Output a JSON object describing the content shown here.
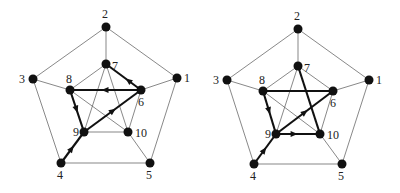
{
  "figure": {
    "type": "Petersen graph with directed path highlights",
    "panels": [
      {
        "id": "left",
        "nodes": [
          {
            "id": "1",
            "x": 177,
            "y": 78,
            "lx": 184,
            "ly": 82
          },
          {
            "id": "2",
            "x": 106,
            "y": 27,
            "lx": 102,
            "ly": 18
          },
          {
            "id": "3",
            "x": 33,
            "y": 79,
            "lx": 19,
            "ly": 83
          },
          {
            "id": "4",
            "x": 61,
            "y": 163,
            "lx": 57,
            "ly": 179
          },
          {
            "id": "5",
            "x": 150,
            "y": 163,
            "lx": 146,
            "ly": 179
          },
          {
            "id": "6",
            "x": 141,
            "y": 90,
            "lx": 138,
            "ly": 106
          },
          {
            "id": "7",
            "x": 106,
            "y": 64,
            "lx": 112,
            "ly": 70
          },
          {
            "id": "8",
            "x": 70,
            "y": 90,
            "lx": 66,
            "ly": 83
          },
          {
            "id": "9",
            "x": 84,
            "y": 132,
            "lx": 73,
            "ly": 136
          },
          {
            "id": "10",
            "x": 128,
            "y": 132,
            "lx": 135,
            "ly": 137
          }
        ],
        "thin_edges": [
          [
            "1",
            "2"
          ],
          [
            "2",
            "3"
          ],
          [
            "3",
            "4"
          ],
          [
            "4",
            "5"
          ],
          [
            "5",
            "1"
          ],
          [
            "1",
            "6"
          ],
          [
            "2",
            "7"
          ],
          [
            "3",
            "8"
          ],
          [
            "5",
            "10"
          ],
          [
            "7",
            "9"
          ],
          [
            "7",
            "10"
          ],
          [
            "8",
            "10"
          ],
          [
            "9",
            "10"
          ],
          [
            "6",
            "10"
          ],
          [
            "7",
            "8"
          ]
        ],
        "thick_edges": [
          {
            "from": "4",
            "to": "9",
            "arrow_t": 0.45
          },
          {
            "from": "9",
            "to": "6",
            "arrow_t": 0.5
          },
          {
            "from": "6",
            "to": "8",
            "arrow_t": 0.5
          },
          {
            "from": "8",
            "to": "9",
            "arrow_t": 0.45
          },
          {
            "from": "6",
            "to": "7",
            "arrow_t": 0.35
          }
        ]
      },
      {
        "id": "right",
        "nodes": [
          {
            "id": "1",
            "x": 369,
            "y": 80,
            "lx": 376,
            "ly": 84
          },
          {
            "id": "2",
            "x": 298,
            "y": 29,
            "lx": 294,
            "ly": 20
          },
          {
            "id": "3",
            "x": 227,
            "y": 80,
            "lx": 213,
            "ly": 84
          },
          {
            "id": "4",
            "x": 254,
            "y": 164,
            "lx": 250,
            "ly": 180
          },
          {
            "id": "5",
            "x": 342,
            "y": 164,
            "lx": 338,
            "ly": 180
          },
          {
            "id": "6",
            "x": 333,
            "y": 91,
            "lx": 330,
            "ly": 107
          },
          {
            "id": "7",
            "x": 298,
            "y": 66,
            "lx": 304,
            "ly": 72
          },
          {
            "id": "8",
            "x": 263,
            "y": 91,
            "lx": 259,
            "ly": 84
          },
          {
            "id": "9",
            "x": 276,
            "y": 134,
            "lx": 265,
            "ly": 138
          },
          {
            "id": "10",
            "x": 320,
            "y": 134,
            "lx": 327,
            "ly": 139
          }
        ],
        "thin_edges": [
          [
            "1",
            "2"
          ],
          [
            "2",
            "3"
          ],
          [
            "3",
            "4"
          ],
          [
            "4",
            "5"
          ],
          [
            "5",
            "1"
          ],
          [
            "1",
            "6"
          ],
          [
            "2",
            "7"
          ],
          [
            "3",
            "8"
          ],
          [
            "5",
            "10"
          ],
          [
            "7",
            "9"
          ],
          [
            "6",
            "7"
          ],
          [
            "8",
            "10"
          ],
          [
            "6",
            "10"
          ],
          [
            "7",
            "8"
          ]
        ],
        "thick_edges": [
          {
            "from": "4",
            "to": "9",
            "arrow_t": 0.45
          },
          {
            "from": "9",
            "to": "6",
            "arrow_t": 0.5
          },
          {
            "from": "6",
            "to": "8",
            "arrow_t": -1
          },
          {
            "from": "8",
            "to": "9",
            "arrow_t": 0.45
          },
          {
            "from": "9",
            "to": "10",
            "arrow_t": 0.4
          },
          {
            "from": "7",
            "to": "10",
            "arrow_t": -1
          }
        ]
      }
    ]
  }
}
